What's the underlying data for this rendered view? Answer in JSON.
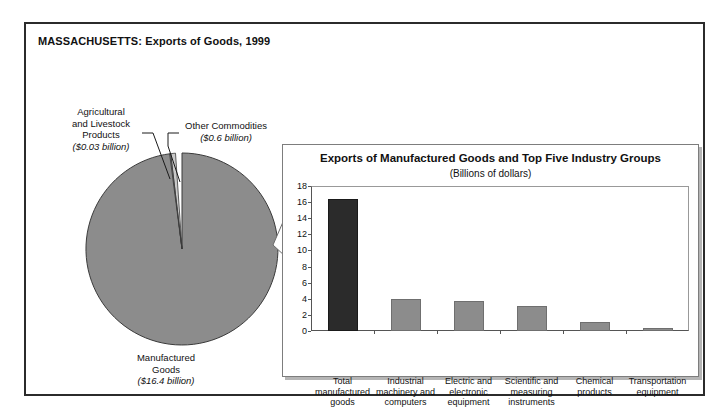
{
  "figure": {
    "title": "MASSACHUSETTS: Exports of Goods, 1999"
  },
  "pie": {
    "slices": [
      {
        "key": "manufactured",
        "name": "Manufactured Goods",
        "name_line1": "Manufactured",
        "name_line2": "Goods",
        "amount_label": "($16.4 billion)",
        "value": 16.4,
        "color": "#8c8c8c"
      },
      {
        "key": "other_commodities",
        "name": "Other Commodities",
        "amount_label": "($0.6 billion)",
        "value": 0.6,
        "color": "#c9c9c9"
      },
      {
        "key": "agricultural",
        "name": "Agricultural and Livestock Products",
        "name_line1": "Agricultural",
        "name_line2": "and Livestock",
        "name_line3": "Products",
        "amount_label": "($0.03 billion)",
        "value": 0.03,
        "color": "#8c8c8c"
      }
    ]
  },
  "bar_panel": {
    "title": "Exports of Manufactured Goods and Top Five Industry Groups",
    "subtitle": "(Billions of dollars)"
  },
  "chart_data": {
    "type": "bar",
    "title": "Exports of Manufactured Goods and Top Five Industry Groups",
    "subtitle": "(Billions of dollars)",
    "xlabel": "",
    "ylabel": "",
    "ylim": [
      0,
      18
    ],
    "yticks": [
      0,
      2,
      4,
      6,
      8,
      10,
      12,
      14,
      16,
      18
    ],
    "grid": false,
    "legend": null,
    "categories": [
      "Total manufactured goods",
      "Industrial machinery and computers",
      "Electric and electronic equipment",
      "Scientific and measuring instruments",
      "Chemical products",
      "Transportation equipment"
    ],
    "category_lines": [
      [
        "Total",
        "manufactured",
        "goods"
      ],
      [
        "Industrial",
        "machinery and",
        "computers"
      ],
      [
        "Electric and",
        "electronic",
        "equipment"
      ],
      [
        "Scientific and",
        "measuring",
        "instruments"
      ],
      [
        "Chemical",
        "products"
      ],
      [
        "Transportation",
        "equipment"
      ]
    ],
    "values": [
      16.4,
      4.0,
      3.7,
      3.1,
      1.1,
      0.35
    ],
    "colors": [
      "#2b2b2b",
      "#8c8c8c",
      "#8c8c8c",
      "#8c8c8c",
      "#8c8c8c",
      "#8c8c8c"
    ]
  },
  "colors": {
    "border": "#2b2b2b",
    "panel_border": "#7d7d7d",
    "pie_main": "#8c8c8c",
    "pie_light": "#c9c9c9",
    "bar_highlight": "#2b2b2b",
    "bar_normal": "#8c8c8c"
  }
}
